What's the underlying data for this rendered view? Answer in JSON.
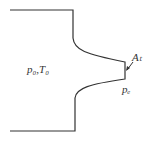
{
  "diagram": {
    "type": "converging-nozzle",
    "labels": {
      "reservoir": "p₀,T₀",
      "throat_area": "Aₜ",
      "exit_pressure": "pₑ"
    },
    "colors": {
      "stroke": "#333333",
      "background": "#ffffff"
    }
  }
}
